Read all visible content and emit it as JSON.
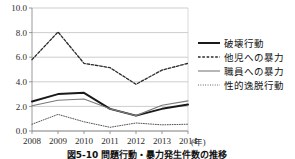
{
  "chart_data": {
    "type": "line",
    "title": "",
    "xlabel": "年",
    "ylabel": "",
    "x": [
      "2008",
      "2009",
      "2010",
      "2011",
      "2012",
      "2013",
      "2014"
    ],
    "categories": [
      "2008",
      "2009",
      "2010",
      "2011",
      "2012",
      "2013",
      "2014"
    ],
    "ylim": [
      0.0,
      10.0
    ],
    "yticks": [
      "0.0",
      "2.0",
      "4.0",
      "6.0",
      "8.0",
      "10.0"
    ],
    "ytick_values": [
      0.0,
      2.0,
      4.0,
      6.0,
      8.0,
      10.0
    ],
    "grid": true,
    "legend_position": "right",
    "series": [
      {
        "name": "破壊行動",
        "style": "solid-thick",
        "color": "#1a1a1a",
        "values": [
          2.4,
          3.0,
          3.1,
          1.8,
          1.25,
          1.8,
          2.15
        ]
      },
      {
        "name": "他児への暴力",
        "style": "dashed",
        "color": "#2b2b2b",
        "values": [
          5.8,
          8.05,
          5.5,
          5.15,
          3.8,
          4.95,
          5.5
        ]
      },
      {
        "name": "職員への暴力",
        "style": "solid-thin",
        "color": "#7a7a7a",
        "values": [
          2.05,
          2.5,
          2.6,
          1.8,
          1.25,
          2.1,
          2.45
        ]
      },
      {
        "name": "性的逸脱行動",
        "style": "dotted",
        "color": "#555555",
        "values": [
          0.55,
          1.35,
          0.75,
          0.3,
          0.65,
          0.5,
          0.55
        ]
      }
    ]
  },
  "axis": {
    "x_unit_label": "(年)"
  },
  "caption": {
    "text": "図5-10 問題行動・暴力発生件数の推移"
  },
  "colors": {
    "grid": "#b8b8b8",
    "axis": "#808080",
    "series_destructive": "#1a1a1a",
    "series_peer_violence": "#2b2b2b",
    "series_staff_violence": "#7a7a7a",
    "series_sexual_deviance": "#555555"
  }
}
